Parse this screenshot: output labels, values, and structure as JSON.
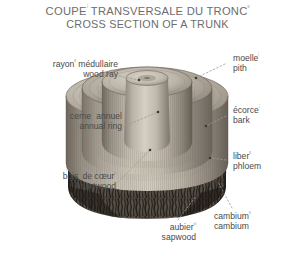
{
  "title": {
    "line1_text": "COUPE",
    "line1_sup": "ⁱ",
    "line1_rest": " TRANSVERSALE DU TRONC",
    "line1_sup2": "ᴵᴵ",
    "line2": "CROSS SECTION OF A TRUNK"
  },
  "labels": {
    "wood_ray": {
      "fr": "rayon",
      "fr_sup": "ᴵᴵ",
      "fr_rest": " médullaire",
      "en": "wood ray"
    },
    "annual_ring": {
      "fr": "cerne",
      "fr_sup": "ᴵᵛ",
      "fr_rest": " annuel",
      "en": "annual ring"
    },
    "heartwood": {
      "fr": "bois",
      "fr_sup": "ᵛ",
      "fr_mid": " de cœur",
      "fr_sup2": "ᵛ",
      "en": "heartwood"
    },
    "sapwood": {
      "fr": "aubier",
      "fr_sup": "ᵛᴵ",
      "en": "sapwood"
    },
    "pith": {
      "fr": "moelle",
      "fr_sup": "ⁱ",
      "en": "pith"
    },
    "bark": {
      "fr": "écorce",
      "fr_sup": "ⁱ",
      "en": "bark"
    },
    "phloem": {
      "fr": "liber",
      "fr_sup": "ᴵᴵ",
      "en": "phloem"
    },
    "cambium": {
      "fr": "cambium",
      "fr_sup": "ᴵᴵ",
      "en": "cambium"
    }
  },
  "colors": {
    "background": "#ffffff",
    "title_text": "#6d6d6d",
    "label_text": "#4a4a4a",
    "leader_line": "#9a9a9a",
    "bark_dark": "#3a3632",
    "bark_mid": "#585249",
    "wood_light": "#c9c2b6",
    "wood_mid": "#a9a094",
    "wood_shadow": "#7e766b",
    "pith_top": "#cdc6ba"
  },
  "illustration": {
    "name": "tree-trunk-cross-section",
    "description": "Stepped cutaway of a tree trunk showing concentric cylindrical layers with rough dark bark on the lower exterior"
  }
}
